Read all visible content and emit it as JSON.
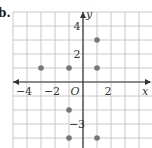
{
  "part_label": "b.",
  "chart_data": {
    "type": "scatter",
    "title": "",
    "xlabel": "x",
    "ylabel": "y",
    "origin_label": "O",
    "xlim": [
      -5,
      5
    ],
    "ylim": [
      -5,
      5
    ],
    "grid": true,
    "x_tick_labels": [
      {
        "value": -4,
        "label": "−4"
      },
      {
        "value": -2,
        "label": "−2"
      },
      {
        "value": 2,
        "label": "2"
      }
    ],
    "y_tick_labels": [
      {
        "value": 4,
        "label": "4"
      },
      {
        "value": 2,
        "label": "2"
      },
      {
        "value": -3,
        "label": "−3"
      }
    ],
    "points": [
      {
        "x": -3,
        "y": 1
      },
      {
        "x": -1,
        "y": 1
      },
      {
        "x": 1,
        "y": 1
      },
      {
        "x": 1,
        "y": 3
      },
      {
        "x": -1,
        "y": -2
      },
      {
        "x": -1,
        "y": -4
      },
      {
        "x": 1,
        "y": -4
      }
    ],
    "colors": {
      "grid": "#c8c8c8",
      "axis": "#333333",
      "point": "#777777"
    }
  }
}
